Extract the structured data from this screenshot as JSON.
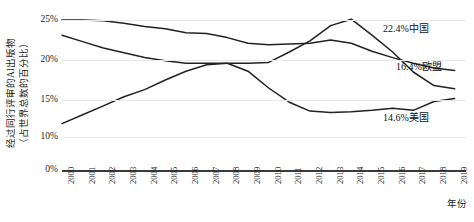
{
  "chart_data": {
    "type": "line",
    "title": "",
    "xlabel": "年份",
    "ylabel_line1": "经过同行评审的AI出版物",
    "ylabel_line2": "（占世界总数的百分比）",
    "x": [
      "2000",
      "2001",
      "2002",
      "2003",
      "2004",
      "2005",
      "2006",
      "2007",
      "2008",
      "2009",
      "2010",
      "2011",
      "2012",
      "2013",
      "2014",
      "2015",
      "2016",
      "2017",
      "2018",
      "2019"
    ],
    "ytick_labels": [
      "0%",
      "10%",
      "15%",
      "20%",
      "25%"
    ],
    "ytick_values": [
      0,
      10,
      15,
      20,
      25
    ],
    "ylim": [
      0,
      26
    ],
    "grid": true,
    "legend_position": "end-of-line",
    "series": [
      {
        "name": "中国",
        "end_label": "22.4%中国",
        "end_value": 22.4,
        "color": "#222222",
        "values": [
          11.8,
          13.0,
          14.2,
          15.4,
          16.3,
          17.5,
          18.6,
          19.4,
          19.6,
          19.6,
          19.7,
          21.0,
          22.4,
          24.3,
          25.1,
          23.1,
          21.0,
          18.5,
          16.8,
          16.4
        ]
      },
      {
        "name": "欧盟",
        "end_label": "16.4%欧盟",
        "end_value": 16.4,
        "color": "#222222",
        "values": [
          25.0,
          25.0,
          24.9,
          24.6,
          24.2,
          23.9,
          23.4,
          23.3,
          22.8,
          22.1,
          21.9,
          22.0,
          22.1,
          22.5,
          22.1,
          21.1,
          20.3,
          19.6,
          19.0,
          18.7
        ]
      },
      {
        "name": "美国",
        "end_label": "14.6%美国",
        "end_value": 14.6,
        "color": "#222222",
        "values": [
          23.1,
          22.3,
          21.5,
          20.9,
          20.3,
          19.9,
          19.6,
          19.6,
          19.6,
          18.6,
          16.5,
          14.7,
          13.5,
          13.3,
          13.4,
          13.6,
          13.9,
          13.6,
          14.8,
          15.2
        ]
      }
    ],
    "notes": {
      "series_china_peak_year": "2014",
      "series_china_peak_value": 25.1,
      "line_style": "solid black"
    }
  }
}
